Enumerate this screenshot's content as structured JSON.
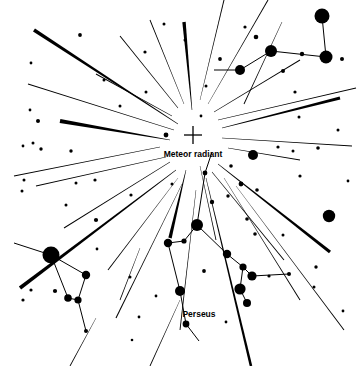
{
  "figure": {
    "width": 357,
    "height": 366,
    "background_color": "#ffffff",
    "ink_color": "#000000"
  },
  "labels": [
    {
      "name": "meteor-radiant-label",
      "text": "Meteor radiant",
      "x": 193,
      "y": 155,
      "font_size": 8.5
    },
    {
      "name": "perseus-label",
      "text": "Perseus",
      "x": 199,
      "y": 315,
      "font_size": 8.5
    }
  ],
  "radiant": {
    "name": "meteor-radiant-marker",
    "marker": "cross",
    "x": 193,
    "y": 135,
    "arm_length": 9,
    "stroke_width": 1.3
  },
  "chart_data": {
    "type": "scatter",
    "xlabel": "",
    "ylabel": "",
    "xlim": [
      0,
      357
    ],
    "ylim": [
      0,
      366
    ],
    "grid": false,
    "legend": "none",
    "annotations": [
      "Meteor radiant",
      "Perseus"
    ],
    "stars": [
      {
        "x": 322,
        "y": 16,
        "r": 7.5
      },
      {
        "x": 326,
        "y": 57,
        "r": 6.5
      },
      {
        "x": 271,
        "y": 51,
        "r": 6.0
      },
      {
        "x": 240,
        "y": 70,
        "r": 5.0
      },
      {
        "x": 302,
        "y": 54,
        "r": 2.2
      },
      {
        "x": 283,
        "y": 71,
        "r": 2.0
      },
      {
        "x": 256,
        "y": 37,
        "r": 2.3
      },
      {
        "x": 342,
        "y": 59,
        "r": 2.0
      },
      {
        "x": 220,
        "y": 59,
        "r": 1.9
      },
      {
        "x": 245,
        "y": 27,
        "r": 1.6
      },
      {
        "x": 295,
        "y": 92,
        "r": 1.6
      },
      {
        "x": 329,
        "y": 216,
        "r": 6.2
      },
      {
        "x": 318,
        "y": 148,
        "r": 1.8
      },
      {
        "x": 338,
        "y": 130,
        "r": 1.5
      },
      {
        "x": 300,
        "y": 176,
        "r": 1.6
      },
      {
        "x": 255,
        "y": 234,
        "r": 1.8
      },
      {
        "x": 283,
        "y": 235,
        "r": 1.5
      },
      {
        "x": 316,
        "y": 267,
        "r": 1.7
      },
      {
        "x": 314,
        "y": 287,
        "r": 1.5
      },
      {
        "x": 343,
        "y": 311,
        "r": 1.4
      },
      {
        "x": 269,
        "y": 276,
        "r": 1.6
      },
      {
        "x": 289,
        "y": 274,
        "r": 2.0
      },
      {
        "x": 252,
        "y": 276,
        "r": 4.6
      },
      {
        "x": 197,
        "y": 225,
        "r": 6.0
      },
      {
        "x": 227,
        "y": 254,
        "r": 4.2
      },
      {
        "x": 243,
        "y": 267,
        "r": 3.6
      },
      {
        "x": 240,
        "y": 289,
        "r": 5.6
      },
      {
        "x": 247,
        "y": 303,
        "r": 4.0
      },
      {
        "x": 168,
        "y": 243,
        "r": 4.2
      },
      {
        "x": 184,
        "y": 241,
        "r": 2.6
      },
      {
        "x": 180,
        "y": 291,
        "r": 5.0
      },
      {
        "x": 186,
        "y": 324,
        "r": 3.4
      },
      {
        "x": 212,
        "y": 202,
        "r": 2.2
      },
      {
        "x": 241,
        "y": 184,
        "r": 2.4
      },
      {
        "x": 257,
        "y": 190,
        "r": 1.8
      },
      {
        "x": 231,
        "y": 166,
        "r": 1.8
      },
      {
        "x": 228,
        "y": 196,
        "r": 1.7
      },
      {
        "x": 247,
        "y": 219,
        "r": 1.8
      },
      {
        "x": 204,
        "y": 271,
        "r": 1.9
      },
      {
        "x": 226,
        "y": 322,
        "r": 1.4
      },
      {
        "x": 205,
        "y": 173,
        "r": 2.4
      },
      {
        "x": 253,
        "y": 155,
        "r": 5.0
      },
      {
        "x": 51,
        "y": 255,
        "r": 8.5
      },
      {
        "x": 86,
        "y": 275,
        "r": 4.2
      },
      {
        "x": 68,
        "y": 298,
        "r": 3.8
      },
      {
        "x": 78,
        "y": 300,
        "r": 3.6
      },
      {
        "x": 55,
        "y": 291,
        "r": 2.1
      },
      {
        "x": 86,
        "y": 331,
        "r": 2.0
      },
      {
        "x": 31,
        "y": 290,
        "r": 1.6
      },
      {
        "x": 23,
        "y": 300,
        "r": 1.6
      },
      {
        "x": 130,
        "y": 277,
        "r": 1.5
      },
      {
        "x": 139,
        "y": 317,
        "r": 1.4
      },
      {
        "x": 166,
        "y": 135,
        "r": 2.4
      },
      {
        "x": 38,
        "y": 121,
        "r": 2.0
      },
      {
        "x": 41,
        "y": 149,
        "r": 1.7
      },
      {
        "x": 71,
        "y": 151,
        "r": 1.7
      },
      {
        "x": 95,
        "y": 180,
        "r": 1.6
      },
      {
        "x": 96,
        "y": 220,
        "r": 2.1
      },
      {
        "x": 131,
        "y": 195,
        "r": 1.6
      },
      {
        "x": 97,
        "y": 249,
        "r": 1.4
      },
      {
        "x": 76,
        "y": 183,
        "r": 1.5
      },
      {
        "x": 24,
        "y": 180,
        "r": 1.5
      },
      {
        "x": 22,
        "y": 191,
        "r": 1.5
      },
      {
        "x": 30,
        "y": 110,
        "r": 1.4
      },
      {
        "x": 33,
        "y": 143,
        "r": 1.5
      },
      {
        "x": 23,
        "y": 146,
        "r": 1.4
      },
      {
        "x": 80,
        "y": 35,
        "r": 1.9
      },
      {
        "x": 146,
        "y": 92,
        "r": 1.5
      },
      {
        "x": 185,
        "y": 40,
        "r": 1.5
      },
      {
        "x": 164,
        "y": 24,
        "r": 1.5
      },
      {
        "x": 206,
        "y": 86,
        "r": 1.5
      },
      {
        "x": 201,
        "y": 116,
        "r": 1.4
      },
      {
        "x": 145,
        "y": 52,
        "r": 1.6
      },
      {
        "x": 120,
        "y": 106,
        "r": 1.5
      },
      {
        "x": 104,
        "y": 80,
        "r": 1.5
      },
      {
        "x": 66,
        "y": 205,
        "r": 1.5
      },
      {
        "x": 172,
        "y": 184,
        "r": 1.5
      },
      {
        "x": 156,
        "y": 296,
        "r": 1.4
      },
      {
        "x": 31,
        "y": 63,
        "r": 1.4
      },
      {
        "x": 299,
        "y": 117,
        "r": 1.5
      },
      {
        "x": 278,
        "y": 147,
        "r": 1.6
      },
      {
        "x": 293,
        "y": 151,
        "r": 1.5
      },
      {
        "x": 348,
        "y": 181,
        "r": 1.4
      },
      {
        "x": 132,
        "y": 340,
        "r": 1.3
      }
    ],
    "constellation_lines": [
      {
        "name": "cassiopeia-seg-1",
        "x1": 322,
        "y1": 16,
        "x2": 326,
        "y2": 57
      },
      {
        "name": "cassiopeia-seg-2",
        "x1": 326,
        "y1": 57,
        "x2": 271,
        "y2": 51
      },
      {
        "name": "cassiopeia-seg-3",
        "x1": 271,
        "y1": 51,
        "x2": 240,
        "y2": 70
      },
      {
        "name": "cassiopeia-seg-4",
        "x1": 240,
        "y1": 70,
        "x2": 214,
        "y2": 70
      },
      {
        "name": "perseus-seg-1",
        "x1": 197,
        "y1": 225,
        "x2": 184,
        "y2": 241
      },
      {
        "name": "perseus-seg-2",
        "x1": 184,
        "y1": 241,
        "x2": 168,
        "y2": 243
      },
      {
        "name": "perseus-seg-3",
        "x1": 168,
        "y1": 243,
        "x2": 180,
        "y2": 291
      },
      {
        "name": "perseus-seg-4",
        "x1": 180,
        "y1": 291,
        "x2": 186,
        "y2": 324
      },
      {
        "name": "perseus-seg-5",
        "x1": 186,
        "y1": 324,
        "x2": 199,
        "y2": 341
      },
      {
        "name": "perseus-seg-6",
        "x1": 197,
        "y1": 225,
        "x2": 227,
        "y2": 254
      },
      {
        "name": "perseus-seg-7",
        "x1": 227,
        "y1": 254,
        "x2": 243,
        "y2": 267
      },
      {
        "name": "perseus-seg-8",
        "x1": 243,
        "y1": 267,
        "x2": 240,
        "y2": 289
      },
      {
        "name": "perseus-seg-9",
        "x1": 240,
        "y1": 289,
        "x2": 247,
        "y2": 303
      },
      {
        "name": "perseus-seg-10",
        "x1": 197,
        "y1": 225,
        "x2": 205,
        "y2": 173
      },
      {
        "name": "perseus-seg-11",
        "x1": 205,
        "y1": 173,
        "x2": 212,
        "y2": 152
      },
      {
        "name": "perseus-seg-12",
        "x1": 243,
        "y1": 267,
        "x2": 252,
        "y2": 276
      },
      {
        "name": "perseus-seg-13",
        "x1": 252,
        "y1": 276,
        "x2": 289,
        "y2": 274
      },
      {
        "name": "auriga-seg-1",
        "x1": 51,
        "y1": 255,
        "x2": 86,
        "y2": 275
      },
      {
        "name": "auriga-seg-2",
        "x1": 86,
        "y1": 275,
        "x2": 78,
        "y2": 300
      },
      {
        "name": "auriga-seg-3",
        "x1": 78,
        "y1": 300,
        "x2": 68,
        "y2": 298
      },
      {
        "name": "auriga-seg-4",
        "x1": 68,
        "y1": 298,
        "x2": 51,
        "y2": 255
      },
      {
        "name": "auriga-seg-5",
        "x1": 51,
        "y1": 255,
        "x2": 14,
        "y2": 243
      },
      {
        "name": "auriga-seg-6",
        "x1": 78,
        "y1": 300,
        "x2": 86,
        "y2": 331
      }
    ],
    "meteor_trails": [
      {
        "name": "trail-nw-1",
        "x1": 178,
        "y1": 124,
        "x2": 34,
        "y2": 30,
        "w_near": 0.5,
        "w_far": 3.6
      },
      {
        "name": "trail-nw-2",
        "x1": 174,
        "y1": 130,
        "x2": 28,
        "y2": 84,
        "w_near": 0.4,
        "w_far": 1.0
      },
      {
        "name": "trail-nw-3",
        "x1": 170,
        "y1": 140,
        "x2": 60,
        "y2": 121,
        "w_near": 0.5,
        "w_far": 4.2
      },
      {
        "name": "trail-w-1",
        "x1": 160,
        "y1": 147,
        "x2": 14,
        "y2": 176,
        "w_near": 0.4,
        "w_far": 1.1
      },
      {
        "name": "trail-w-2",
        "x1": 166,
        "y1": 157,
        "x2": 36,
        "y2": 186,
        "w_near": 0.4,
        "w_far": 0.9
      },
      {
        "name": "trail-sw-1",
        "x1": 170,
        "y1": 162,
        "x2": 64,
        "y2": 228,
        "w_near": 0.4,
        "w_far": 1.0
      },
      {
        "name": "trail-sw-2",
        "x1": 176,
        "y1": 170,
        "x2": 20,
        "y2": 288,
        "w_near": 0.5,
        "w_far": 3.8
      },
      {
        "name": "trail-sw-3",
        "x1": 178,
        "y1": 178,
        "x2": 108,
        "y2": 270,
        "w_near": 0.4,
        "w_far": 1.0
      },
      {
        "name": "trail-sw-4",
        "x1": 182,
        "y1": 184,
        "x2": 116,
        "y2": 318,
        "w_near": 0.4,
        "w_far": 1.1
      },
      {
        "name": "trail-s-1",
        "x1": 186,
        "y1": 170,
        "x2": 170,
        "y2": 238,
        "w_near": 0.5,
        "w_far": 3.4
      },
      {
        "name": "trail-s-2",
        "x1": 200,
        "y1": 166,
        "x2": 216,
        "y2": 240,
        "w_near": 0.4,
        "w_far": 0.9
      },
      {
        "name": "trail-s-3",
        "x1": 206,
        "y1": 178,
        "x2": 251,
        "y2": 366,
        "w_near": 0.5,
        "w_far": 2.6
      },
      {
        "name": "trail-s-4",
        "x1": 196,
        "y1": 190,
        "x2": 180,
        "y2": 330,
        "w_near": 0.4,
        "w_far": 0.9
      },
      {
        "name": "trail-se-1",
        "x1": 212,
        "y1": 172,
        "x2": 284,
        "y2": 260,
        "w_near": 0.4,
        "w_far": 1.0
      },
      {
        "name": "trail-se-2",
        "x1": 218,
        "y1": 164,
        "x2": 330,
        "y2": 252,
        "w_near": 0.5,
        "w_far": 3.2
      },
      {
        "name": "trail-se-3",
        "x1": 224,
        "y1": 178,
        "x2": 300,
        "y2": 300,
        "w_near": 0.4,
        "w_far": 1.0
      },
      {
        "name": "trail-se-4",
        "x1": 236,
        "y1": 186,
        "x2": 344,
        "y2": 330,
        "w_near": 0.4,
        "w_far": 1.0
      },
      {
        "name": "trail-e-1",
        "x1": 228,
        "y1": 148,
        "x2": 300,
        "y2": 160,
        "w_near": 0.4,
        "w_far": 0.9
      },
      {
        "name": "trail-e-2",
        "x1": 222,
        "y1": 138,
        "x2": 352,
        "y2": 146,
        "w_near": 0.4,
        "w_far": 1.0
      },
      {
        "name": "trail-ne-1",
        "x1": 222,
        "y1": 128,
        "x2": 340,
        "y2": 98,
        "w_near": 0.5,
        "w_far": 3.0
      },
      {
        "name": "trail-ne-2",
        "x1": 218,
        "y1": 120,
        "x2": 356,
        "y2": 88,
        "w_near": 0.4,
        "w_far": 1.0
      },
      {
        "name": "trail-ne-3",
        "x1": 214,
        "y1": 112,
        "x2": 300,
        "y2": 60,
        "w_near": 0.4,
        "w_far": 0.9
      },
      {
        "name": "trail-ne-4",
        "x1": 208,
        "y1": 104,
        "x2": 268,
        "y2": 0,
        "w_near": 0.4,
        "w_far": 1.0
      },
      {
        "name": "trail-n-1",
        "x1": 200,
        "y1": 100,
        "x2": 224,
        "y2": 0,
        "w_near": 0.4,
        "w_far": 1.0
      },
      {
        "name": "trail-n-2",
        "x1": 192,
        "y1": 110,
        "x2": 184,
        "y2": 22,
        "w_near": 0.5,
        "w_far": 3.4
      },
      {
        "name": "trail-n-3",
        "x1": 184,
        "y1": 104,
        "x2": 150,
        "y2": 20,
        "w_near": 0.4,
        "w_far": 0.9
      },
      {
        "name": "trail-n-4",
        "x1": 178,
        "y1": 108,
        "x2": 120,
        "y2": 36,
        "w_near": 0.4,
        "w_far": 1.0
      },
      {
        "name": "trail-nw-4",
        "x1": 172,
        "y1": 116,
        "x2": 96,
        "y2": 74,
        "w_near": 0.4,
        "w_far": 0.9
      },
      {
        "name": "trail-outer-1",
        "x1": 282,
        "y1": 22,
        "x2": 244,
        "y2": 104,
        "w_near": 0.5,
        "w_far": 0.9
      },
      {
        "name": "trail-outer-2",
        "x1": 180,
        "y1": 300,
        "x2": 150,
        "y2": 366,
        "w_near": 0.4,
        "w_far": 0.9
      },
      {
        "name": "trail-outer-3",
        "x1": 96,
        "y1": 318,
        "x2": 70,
        "y2": 366,
        "w_near": 0.4,
        "w_far": 0.9
      },
      {
        "name": "trail-outer-4",
        "x1": 140,
        "y1": 248,
        "x2": 120,
        "y2": 300,
        "w_near": 0.4,
        "w_far": 0.8
      }
    ]
  }
}
